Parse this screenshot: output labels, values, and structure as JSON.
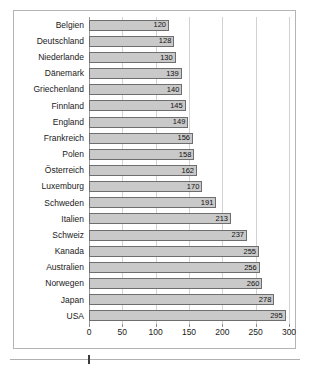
{
  "chart_data": {
    "type": "bar",
    "orientation": "horizontal",
    "title": "",
    "subtitle": "",
    "xlabel": "",
    "ylabel": "",
    "xlim": [
      0,
      300
    ],
    "grid": true,
    "legend": null,
    "xticks": [
      0,
      50,
      100,
      150,
      200,
      250,
      300
    ],
    "xtick_labels": [
      "0",
      "50",
      "100",
      "150",
      "200",
      "250",
      "300"
    ],
    "categories": [
      "Belgien",
      "Deutschland",
      "Niederlande",
      "Dänemark",
      "Griechenland",
      "Finnland",
      "England",
      "Frankreich",
      "Polen",
      "Österreich",
      "Luxemburg",
      "Schweden",
      "Italien",
      "Schweiz",
      "Kanada",
      "Australien",
      "Norwegen",
      "Japan",
      "USA"
    ],
    "values": [
      120,
      128,
      130,
      139,
      140,
      145,
      149,
      156,
      158,
      162,
      170,
      191,
      213,
      237,
      255,
      256,
      260,
      278,
      295
    ],
    "data_labels": [
      "120",
      "128",
      "130",
      "139",
      "140",
      "145",
      "149",
      "156",
      "158",
      "162",
      "170",
      "191",
      "213",
      "237",
      "255",
      "256",
      "260",
      "278",
      "295"
    ],
    "bar_fill_color": "#c9c9c9",
    "bar_border_color": "#6e6e6e",
    "gridline_color": "#d2d2d2",
    "frame_color": "#b4b4b4",
    "background_color": "#ffffff"
  }
}
